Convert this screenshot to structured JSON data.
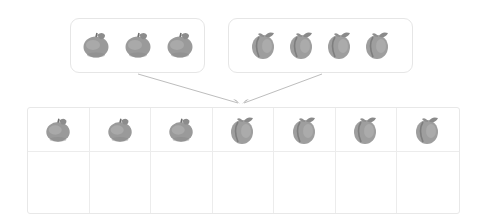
{
  "diagram": {
    "colors": {
      "fruit_fill": "#9a9a9a",
      "fruit_shadow": "#7e7e7e",
      "box_border": "#e6e6e6",
      "arrow": "#b8b8b8"
    },
    "top_left_group": {
      "fruit": "apple",
      "count": 3
    },
    "top_right_group": {
      "fruit": "peach",
      "count": 4
    },
    "grid": {
      "columns": 7,
      "rows": 2,
      "top_row": [
        "apple",
        "apple",
        "apple",
        "peach",
        "peach",
        "peach",
        "peach"
      ],
      "bottom_row": [
        "",
        "",
        "",
        "",
        "",
        "",
        ""
      ]
    }
  }
}
